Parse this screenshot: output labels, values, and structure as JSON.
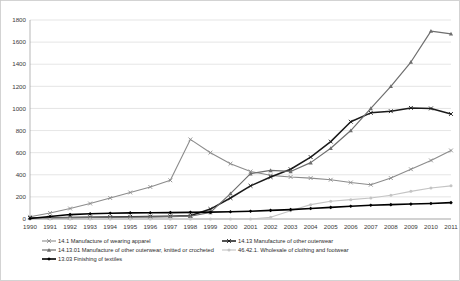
{
  "chart_data": {
    "type": "line",
    "title": "",
    "xlabel": "",
    "ylabel": "",
    "ylim": [
      0,
      1800
    ],
    "ytick_step": 200,
    "grid": true,
    "legend_position": "bottom",
    "categories": [
      "1990",
      "1991",
      "1992",
      "1993",
      "1994",
      "1995",
      "1996",
      "1997",
      "1998",
      "1999",
      "2000",
      "2001",
      "2002",
      "2003",
      "2004",
      "2005",
      "2006",
      "2007",
      "2008",
      "2009",
      "2010",
      "2011"
    ],
    "yticks": [
      0,
      200,
      400,
      600,
      800,
      1000,
      1200,
      1400,
      1600,
      1800
    ],
    "series": [
      {
        "name": "14.1 Manufacture of wearing apparel",
        "color": "#8c8c8c",
        "width": 1.1,
        "marker": "x",
        "values": [
          20,
          55,
          95,
          140,
          190,
          240,
          290,
          350,
          720,
          600,
          500,
          430,
          395,
          380,
          370,
          355,
          330,
          310,
          370,
          450,
          530,
          620
        ]
      },
      {
        "name": "14.13 Manufacture of other outerwear",
        "color": "#1a1a1a",
        "width": 1.5,
        "marker": "x",
        "values": [
          10,
          12,
          14,
          16,
          18,
          20,
          22,
          25,
          30,
          90,
          190,
          300,
          380,
          450,
          560,
          700,
          880,
          960,
          975,
          1005,
          1000,
          950
        ]
      },
      {
        "name": "14.13.01 Manufacture of other outerwear, knitted or crocheted",
        "color": "#6e6e6e",
        "width": 1.2,
        "marker": "triangle",
        "values": [
          8,
          10,
          12,
          14,
          16,
          18,
          20,
          22,
          25,
          60,
          230,
          410,
          440,
          430,
          510,
          640,
          800,
          1000,
          1200,
          1420,
          1700,
          1675
        ]
      },
      {
        "name": "46.42.1. Wholesale of clothing and footwear",
        "color": "#c4c4c4",
        "width": 1.1,
        "marker": "circle",
        "values": [
          0,
          0,
          0,
          0,
          0,
          0,
          0,
          0,
          0,
          0,
          0,
          0,
          15,
          75,
          130,
          160,
          175,
          190,
          215,
          250,
          280,
          300
        ]
      },
      {
        "name": "13.03 Finishing of textiles",
        "color": "#000000",
        "width": 1.6,
        "marker": "diamond",
        "values": [
          5,
          22,
          40,
          48,
          52,
          55,
          57,
          58,
          60,
          62,
          65,
          70,
          78,
          85,
          95,
          105,
          115,
          125,
          130,
          135,
          140,
          148
        ]
      }
    ]
  },
  "legend": {
    "items": [
      {
        "label": "14.1 Manufacture of wearing apparel",
        "series": 0
      },
      {
        "label": "14.13 Manufacture of other outerwear",
        "series": 1
      },
      {
        "label": "14.13.01 Manufacture of other outerwear, knitted or crocheted",
        "series": 2
      },
      {
        "label": "46.42.1. Wholesale of clothing and footwear",
        "series": 3
      },
      {
        "label": "13.03 Finishing of textiles",
        "series": 4
      }
    ]
  }
}
